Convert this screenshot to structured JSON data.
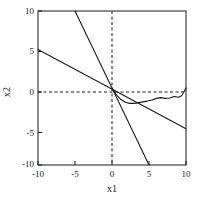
{
  "chart_data": {
    "type": "line",
    "title": "",
    "xlabel": "x1",
    "ylabel": "x2",
    "xlim": [
      -10,
      10
    ],
    "ylim": [
      -10,
      10
    ],
    "xticks": [
      -10,
      -5,
      0,
      5,
      10
    ],
    "xticklabels": [
      "-10",
      "-5",
      "0",
      "5",
      "10"
    ],
    "yticks": [
      -10,
      -5,
      0,
      5,
      10
    ],
    "yticklabels": [
      "-10",
      "-5",
      "0",
      "5",
      "10"
    ],
    "grid": false,
    "legend": null,
    "reference_lines": [
      {
        "name": "zero-vertical",
        "orientation": "vertical",
        "value": 0,
        "style": "dashed"
      },
      {
        "name": "zero-horizontal",
        "orientation": "horizontal",
        "value": 0,
        "style": "dashed"
      }
    ],
    "series": [
      {
        "name": "steep-line",
        "style": "solid",
        "x": [
          -5,
          5
        ],
        "y": [
          10,
          -10
        ]
      },
      {
        "name": "shallow-line",
        "style": "solid",
        "x": [
          -10,
          10
        ],
        "y": [
          5,
          -5.3
        ]
      },
      {
        "name": "wavy-curve",
        "style": "solid",
        "x": [
          0,
          0.6,
          1.2,
          1.8,
          2.4,
          3.0,
          3.6,
          4.2,
          4.8,
          5.4,
          6.0,
          6.6,
          7.2,
          7.8,
          8.4,
          9.0,
          9.4,
          9.7,
          10
        ],
        "y": [
          0,
          -0.9,
          -1.5,
          -1.85,
          -2.0,
          -2.0,
          -1.9,
          -1.8,
          -1.7,
          -1.55,
          -1.35,
          -1.25,
          -1.35,
          -1.3,
          -1.1,
          -1.2,
          -1.0,
          -0.55,
          0
        ]
      }
    ]
  },
  "axes": {
    "x_tick_labels": [
      "-10",
      "-5",
      "0",
      "5",
      "10"
    ],
    "y_tick_labels": [
      "10",
      "5",
      "0",
      "-5",
      "-10"
    ],
    "x_axis_title": "x1",
    "y_axis_title": "x2"
  },
  "colors": {
    "line": "#1a1a1a",
    "axis": "#1a1a1a",
    "background": "#ffffff"
  }
}
